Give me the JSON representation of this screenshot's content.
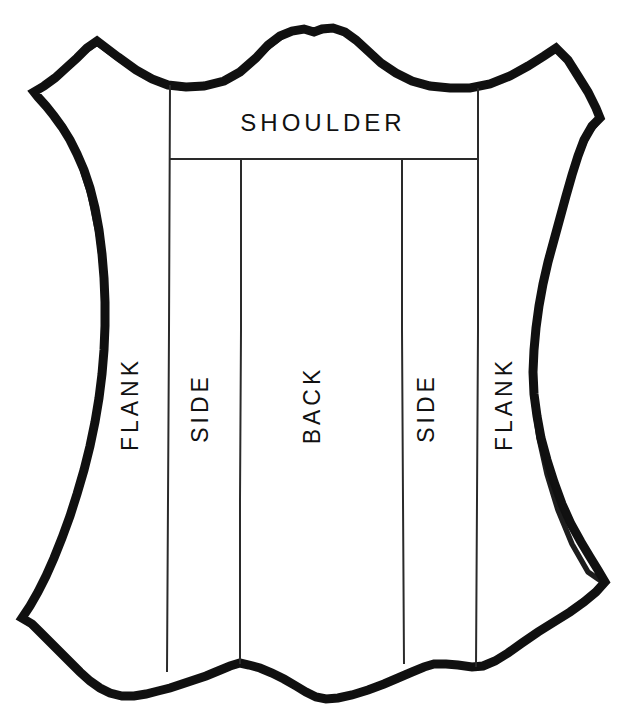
{
  "diagram": {
    "background_color": "#ffffff",
    "outline_color": "#111111",
    "division_line_color": "#2a2a2a",
    "labels": {
      "shoulder": "SHOULDER",
      "back": "BACK",
      "side_left": "SIDE",
      "side_right": "SIDE",
      "flank_left": "FLANK",
      "flank_right": "FLANK"
    },
    "sections": [
      {
        "name": "shoulder",
        "label": "SHOULDER",
        "orientation": "horizontal"
      },
      {
        "name": "flank-left",
        "label": "FLANK",
        "orientation": "vertical-up"
      },
      {
        "name": "side-left",
        "label": "SIDE",
        "orientation": "vertical-up"
      },
      {
        "name": "back",
        "label": "BACK",
        "orientation": "vertical-up"
      },
      {
        "name": "side-right",
        "label": "SIDE",
        "orientation": "vertical-up"
      },
      {
        "name": "flank-right",
        "label": "FLANK",
        "orientation": "vertical-up"
      }
    ]
  }
}
